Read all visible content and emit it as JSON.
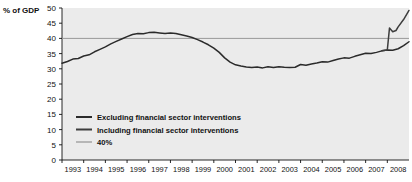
{
  "chart_data": {
    "type": "line",
    "title": "",
    "subtitle": "",
    "ylabel": "% of GDP",
    "xlabel": "",
    "ylim": [
      0,
      50
    ],
    "xlim": [
      1993,
      2009
    ],
    "grid": false,
    "background": "#ebebeb",
    "legend_position": "inside-bottom-left",
    "y_ticks": [
      "0",
      "5",
      "10",
      "15",
      "20",
      "25",
      "30",
      "35",
      "40",
      "45",
      "50"
    ],
    "y_tick_values": [
      0,
      5,
      10,
      15,
      20,
      25,
      30,
      35,
      40,
      45,
      50
    ],
    "x_ticks": [
      "1993",
      "1994",
      "1995",
      "1996",
      "1997",
      "1998",
      "1999",
      "2000",
      "2001",
      "2002",
      "2003",
      "2004",
      "2005",
      "2006",
      "2007",
      "2008"
    ],
    "x_tick_values": [
      1993,
      1994,
      1995,
      1996,
      1997,
      1998,
      1999,
      2000,
      2001,
      2002,
      2003,
      2004,
      2005,
      2006,
      2007,
      2008
    ],
    "reference_line": {
      "label": "40%",
      "value": 40,
      "color": "#999999"
    },
    "colors": {
      "excluding": "#2b2b2b",
      "including": "#3d3d3d",
      "reference": "#999999"
    },
    "series": [
      {
        "name": "Excluding financial sector interventions",
        "color": "#2b2b2b",
        "x": [
          1993.0,
          1993.25,
          1993.5,
          1993.75,
          1994.0,
          1994.25,
          1994.5,
          1994.75,
          1995.0,
          1995.25,
          1995.5,
          1995.75,
          1996.0,
          1996.25,
          1996.5,
          1996.75,
          1997.0,
          1997.25,
          1997.5,
          1997.75,
          1998.0,
          1998.25,
          1998.5,
          1998.75,
          1999.0,
          1999.25,
          1999.5,
          1999.75,
          2000.0,
          2000.25,
          2000.5,
          2000.75,
          2001.0,
          2001.25,
          2001.5,
          2001.75,
          2002.0,
          2002.25,
          2002.5,
          2002.75,
          2003.0,
          2003.25,
          2003.5,
          2003.75,
          2004.0,
          2004.25,
          2004.5,
          2004.75,
          2005.0,
          2005.25,
          2005.5,
          2005.75,
          2006.0,
          2006.25,
          2006.5,
          2006.75,
          2007.0,
          2007.25,
          2007.5,
          2007.75,
          2008.0,
          2008.25,
          2008.5,
          2008.75,
          2009.0
        ],
        "values": [
          31.8,
          32.4,
          33.2,
          33.4,
          34.2,
          34.6,
          35.6,
          36.4,
          37.2,
          38.2,
          39.0,
          39.8,
          40.6,
          41.3,
          41.6,
          41.5,
          41.9,
          42.0,
          41.8,
          41.6,
          41.8,
          41.6,
          41.2,
          40.8,
          40.3,
          39.6,
          38.8,
          37.9,
          36.8,
          35.4,
          33.6,
          32.2,
          31.3,
          30.9,
          30.6,
          30.4,
          30.6,
          30.3,
          30.7,
          30.4,
          30.7,
          30.5,
          30.4,
          30.5,
          31.4,
          31.2,
          31.6,
          31.9,
          32.3,
          32.2,
          32.7,
          33.2,
          33.6,
          33.5,
          34.1,
          34.6,
          35.1,
          35.0,
          35.4,
          35.9,
          36.2,
          36.1,
          36.6,
          37.6,
          38.9
        ]
      },
      {
        "name": "Including financial sector interventions",
        "color": "#3d3d3d",
        "x": [
          2007.75,
          2008.0,
          2008.1,
          2008.25,
          2008.4,
          2008.5,
          2008.75,
          2009.0
        ],
        "values": [
          35.9,
          36.2,
          43.4,
          42.2,
          42.6,
          43.8,
          46.2,
          49.2
        ]
      }
    ]
  },
  "legend": {
    "items": [
      {
        "label": "Excluding financial sector interventions",
        "color": "#2b2b2b"
      },
      {
        "label": "Including financial sector interventions",
        "color": "#3d3d3d"
      },
      {
        "label": "40%",
        "color": "#999999"
      }
    ]
  }
}
